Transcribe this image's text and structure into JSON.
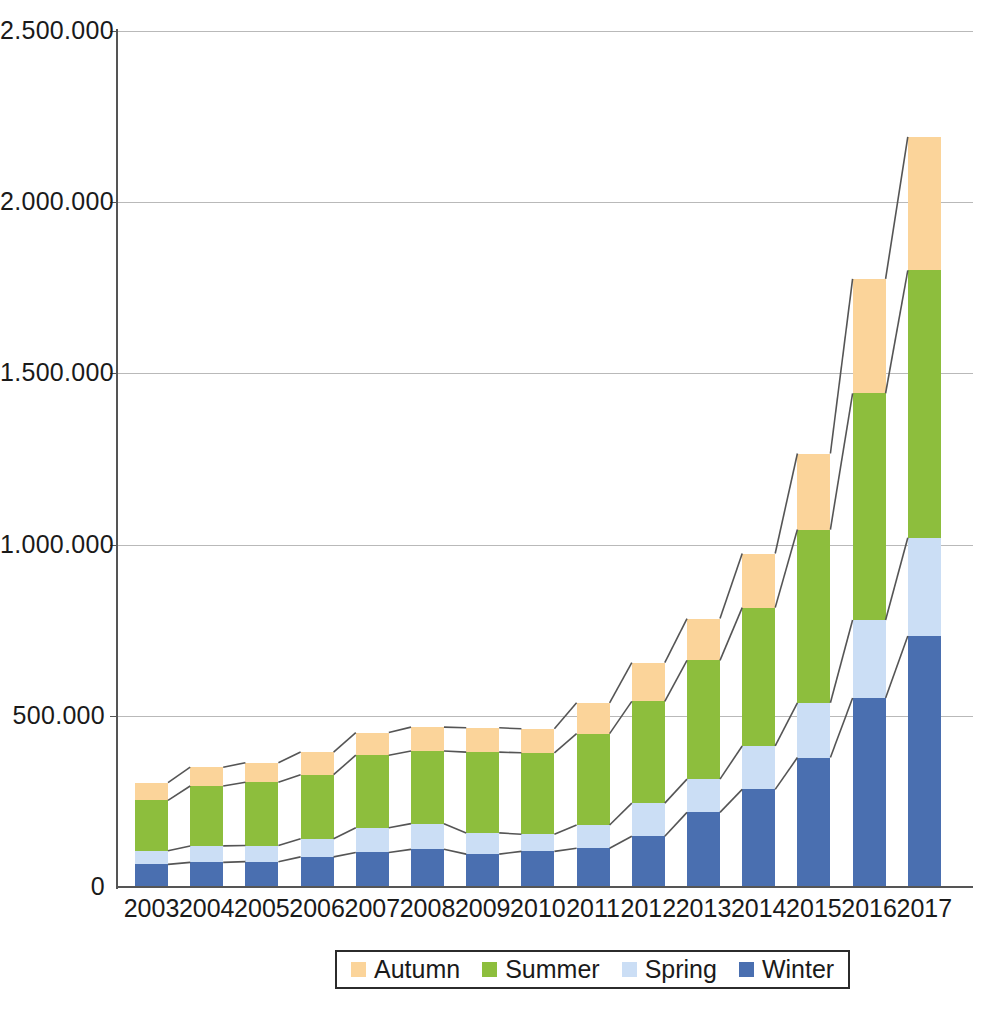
{
  "chart_data": {
    "type": "bar",
    "stacked": true,
    "title": "",
    "xlabel": "",
    "ylabel": "",
    "categories": [
      "2003",
      "2004",
      "2005",
      "2006",
      "2007",
      "2008",
      "2009",
      "2010",
      "2011",
      "2012",
      "2013",
      "2014",
      "2015",
      "2016",
      "2017"
    ],
    "series": [
      {
        "name": "Winter",
        "color": "#4a6fb0",
        "values": [
          66000,
          72000,
          74000,
          88000,
          101000,
          110000,
          96000,
          104000,
          113000,
          148000,
          218000,
          285000,
          378000,
          552000,
          733000
        ]
      },
      {
        "name": "Spring",
        "color": "#cbdef5",
        "values": [
          40000,
          48000,
          47000,
          53000,
          72000,
          75000,
          62000,
          50000,
          68000,
          97000,
          97000,
          127000,
          160000,
          228000,
          287000
        ]
      },
      {
        "name": "Summer",
        "color": "#8dbe3d",
        "values": [
          147000,
          175000,
          185000,
          187000,
          212000,
          212000,
          236000,
          238000,
          267000,
          297000,
          347000,
          404000,
          506000,
          662000,
          781000
        ]
      },
      {
        "name": "Autumn",
        "color": "#fbd49a",
        "values": [
          52000,
          55000,
          57000,
          66000,
          66000,
          70000,
          71000,
          70000,
          90000,
          113000,
          122000,
          158000,
          222000,
          334000,
          390000
        ]
      }
    ],
    "stack_order_bottom_to_top": [
      "Winter",
      "Spring",
      "Summer",
      "Autumn"
    ],
    "totals": [
      305000,
      350000,
      363000,
      394000,
      451000,
      467000,
      465000,
      462000,
      538000,
      655000,
      784000,
      974000,
      1266000,
      1776000,
      2191000
    ],
    "ylim": [
      0,
      2500000
    ],
    "ytick_values": [
      0,
      500000,
      1000000,
      1500000,
      2000000,
      2500000
    ],
    "ytick_labels": [
      "0",
      "500.000",
      "1.000.000",
      "1.500.000",
      "2.000.000",
      "2.500.000"
    ],
    "grid": true,
    "grid_axis": "y",
    "connector_lines": true,
    "connector_color": "#555555",
    "legend_position": "bottom",
    "legend_entries": [
      {
        "label": "Autumn",
        "color": "#fbd49a"
      },
      {
        "label": "Summer",
        "color": "#8dbe3d"
      },
      {
        "label": "Spring",
        "color": "#cbdef5"
      },
      {
        "label": "Winter",
        "color": "#4a6fb0"
      }
    ]
  },
  "caption": {
    "text": ""
  }
}
